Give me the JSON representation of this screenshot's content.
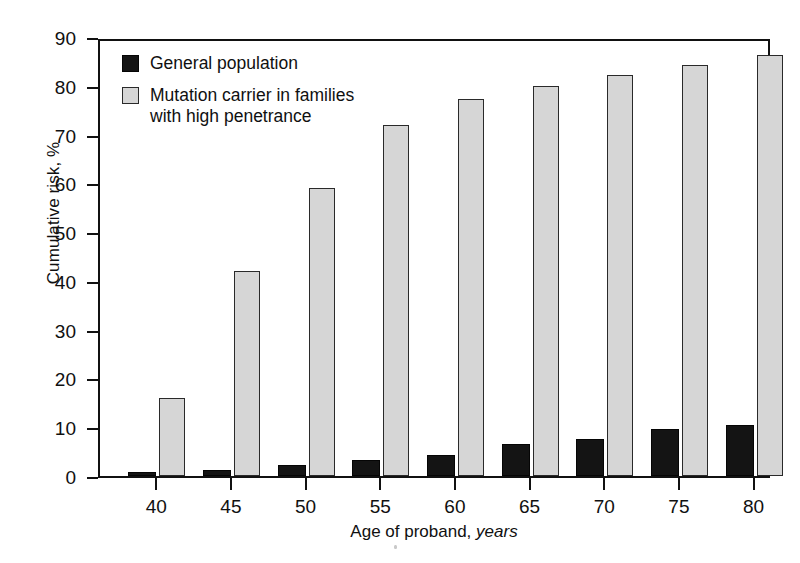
{
  "chart_data": {
    "type": "bar",
    "title": "",
    "subtitle": "",
    "xlabel_prefix": "Age of proband, ",
    "xlabel_emphasis": "years",
    "xlabel": "Age of proband, years",
    "ylabel": "Cumulative risk, %",
    "categories": [
      "40",
      "45",
      "50",
      "55",
      "60",
      "65",
      "70",
      "75",
      "80"
    ],
    "ylim": [
      0,
      90
    ],
    "ytick_values": [
      0,
      10,
      20,
      30,
      40,
      50,
      60,
      70,
      80,
      90
    ],
    "ytick_labels": [
      "0",
      "10",
      "20",
      "30",
      "40",
      "50",
      "60",
      "70",
      "80",
      "90"
    ],
    "grid": false,
    "legend_position": "top-left-inside",
    "series": [
      {
        "name": "General population",
        "key": "general-population",
        "color": "#141414",
        "values": [
          0.8,
          1.3,
          2.2,
          3.2,
          4.3,
          6.5,
          7.6,
          9.6,
          10.5
        ]
      },
      {
        "name": "Mutation carrier in families with high penetrance",
        "key": "mutation-carrier",
        "color": "#d6d6d6",
        "values": [
          16.0,
          42.0,
          59.0,
          72.0,
          77.2,
          80.0,
          82.2,
          84.3,
          86.3
        ]
      }
    ]
  },
  "legend": {
    "entries": [
      {
        "label": "General population",
        "swatch": "dark-square-swatch"
      },
      {
        "label": "Mutation carrier in families\nwith high penetrance",
        "swatch": "light-square-swatch"
      }
    ]
  },
  "axis": {
    "y_title": "Cumulative risk, %",
    "x_title_prefix": "Age of proband, ",
    "x_title_emphasis": "years"
  },
  "colors": {
    "series_dark": "#141414",
    "series_light": "#d6d6d6",
    "axis": "#111111",
    "background": "#ffffff"
  }
}
